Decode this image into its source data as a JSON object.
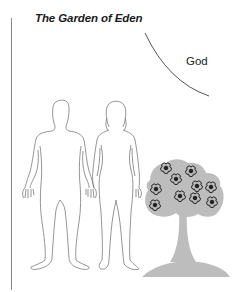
{
  "diagram": {
    "title": "The Garden of Eden",
    "labels": {
      "god": "God"
    },
    "figures": [
      {
        "id": "man",
        "description": "outline of a male human figure"
      },
      {
        "id": "woman",
        "description": "outline of a female human figure holding the man's hand"
      },
      {
        "id": "tree",
        "description": "gray tree with flowers on a mound"
      }
    ],
    "tree": {
      "flower_count": 10,
      "fill_color": "#bdbdbd",
      "flower_color": "#1e1e1e"
    },
    "colors": {
      "outline": "#7a7a7a",
      "divider": "#8a8a8a",
      "god_curve": "#555555"
    }
  }
}
